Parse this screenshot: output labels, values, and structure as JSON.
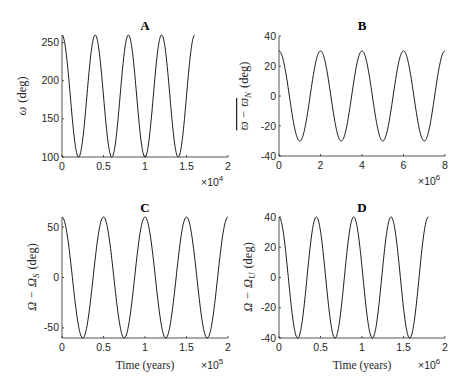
{
  "chart_data": [
    {
      "type": "line",
      "panel": "A",
      "title": "A",
      "xlabel": "",
      "ylabel": "ω (deg)",
      "x_multiplier": "×10^4",
      "xlim": [
        0,
        2
      ],
      "ylim": [
        100,
        260
      ],
      "xticks": [
        "0",
        "0.5",
        "1",
        "1.5",
        "2"
      ],
      "yticks": [
        "100",
        "150",
        "200",
        "250"
      ],
      "ytick_values": [
        100,
        150,
        200,
        250
      ],
      "series": [
        {
          "name": "omega",
          "function": "cosine",
          "center": 180,
          "amplitude": 80,
          "period": 0.4,
          "x_start": 0,
          "x_end": 1.6
        }
      ],
      "grid": false
    },
    {
      "type": "line",
      "panel": "B",
      "title": "B",
      "xlabel": "",
      "ylabel": "ϖ̄ − ϖ̄_N (deg)",
      "x_multiplier": "×10^6",
      "xlim": [
        0,
        8
      ],
      "ylim": [
        -40,
        40
      ],
      "xticks": [
        "0",
        "2",
        "4",
        "6",
        "8"
      ],
      "yticks": [
        "-40",
        "-20",
        "0",
        "20",
        "40"
      ],
      "ytick_values": [
        -40,
        -20,
        0,
        20,
        40
      ],
      "series": [
        {
          "name": "varpi_diff",
          "function": "cosine",
          "center": 0,
          "amplitude": 30,
          "period": 2,
          "x_start": 0,
          "x_end": 8
        }
      ],
      "grid": false
    },
    {
      "type": "line",
      "panel": "C",
      "title": "C",
      "xlabel": "Time (years)",
      "ylabel": "Ω − Ω_S (deg)",
      "x_multiplier": "×10^5",
      "xlim": [
        0,
        2
      ],
      "ylim": [
        -60,
        60
      ],
      "xticks": [
        "0",
        "0.5",
        "1",
        "1.5",
        "2"
      ],
      "yticks": [
        "-50",
        "0",
        "50"
      ],
      "ytick_values": [
        -50,
        0,
        50
      ],
      "series": [
        {
          "name": "Omega_S_diff",
          "function": "cosine",
          "center": 0,
          "amplitude": 60,
          "period": 0.5,
          "x_start": 0,
          "x_end": 2
        }
      ],
      "grid": false
    },
    {
      "type": "line",
      "panel": "D",
      "title": "D",
      "xlabel": "Time (years)",
      "ylabel": "Ω − Ω_U (deg)",
      "x_multiplier": "×10^6",
      "xlim": [
        0,
        2
      ],
      "ylim": [
        -40,
        40
      ],
      "xticks": [
        "0",
        "0.5",
        "1",
        "1.5",
        "2"
      ],
      "yticks": [
        "-40",
        "-20",
        "0",
        "20",
        "40"
      ],
      "ytick_values": [
        -40,
        -20,
        0,
        20,
        40
      ],
      "series": [
        {
          "name": "Omega_U_diff",
          "function": "cosine",
          "center": 0,
          "amplitude": 40,
          "period": 0.45,
          "x_start": 0,
          "x_end": 1.8
        }
      ],
      "grid": false
    }
  ],
  "labels": {
    "A": {
      "title": "A",
      "ylabel_sym": "ω",
      "ylabel_unit": "(deg)",
      "exp_base": "×10",
      "exp_pow": "4"
    },
    "B": {
      "title": "B",
      "ylabel_sym": "ϖ − ϖ",
      "ylabel_sub": "N",
      "ylabel_unit": "(deg)",
      "exp_base": "×10",
      "exp_pow": "6"
    },
    "C": {
      "title": "C",
      "ylabel_sym": "Ω − Ω",
      "ylabel_sub": "S",
      "ylabel_unit": "(deg)",
      "xlabel": "Time (years)",
      "exp_base": "×10",
      "exp_pow": "5"
    },
    "D": {
      "title": "D",
      "ylabel_sym": "Ω − Ω",
      "ylabel_sub": "U",
      "ylabel_unit": "(deg)",
      "xlabel": "Time (years)",
      "exp_base": "×10",
      "exp_pow": "6"
    }
  }
}
